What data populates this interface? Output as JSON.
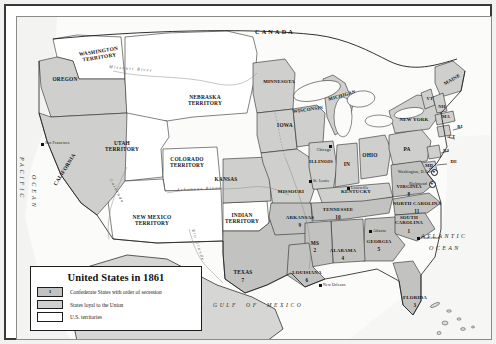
{
  "map": {
    "title": "United States in 1861",
    "legend": {
      "title": "United States in 1861",
      "items": [
        {
          "label": "Confederate States with order of secession",
          "swatch": "confederate",
          "sample_number": "1",
          "color": "#c2c2c0"
        },
        {
          "label": "States loyal to the Union",
          "swatch": "union",
          "color": "#cfcfcd"
        },
        {
          "label": "U.S. territories",
          "swatch": "territory",
          "color": "#ffffff"
        }
      ]
    },
    "countries": [
      {
        "name": "CANADA",
        "x": 268,
        "y": 14
      },
      {
        "name": "MEXICO",
        "x": 175,
        "y": 290
      }
    ],
    "oceans": [
      {
        "name": "PACIFIC",
        "x": 10,
        "y": 150
      },
      {
        "name": "OCEAN",
        "x": 10,
        "y": 185
      },
      {
        "name": "ATLANTIC",
        "x": 412,
        "y": 220
      },
      {
        "name": "OCEAN",
        "x": 420,
        "y": 232
      },
      {
        "name": "GULF  OF  MEXICO",
        "x": 238,
        "y": 288
      }
    ],
    "rivers": [
      {
        "name": "Missouri River",
        "x": 108,
        "y": 57
      },
      {
        "name": "Arkansas River",
        "x": 183,
        "y": 176
      },
      {
        "name": "Colorado",
        "x": 96,
        "y": 182
      },
      {
        "name": "Rio Grande",
        "x": 172,
        "y": 232
      }
    ],
    "confederate_states": [
      {
        "name": "SOUTH\nCAROLINA",
        "order": "1",
        "x": 391,
        "y": 203
      },
      {
        "name": "MS",
        "order": "2",
        "x": 298,
        "y": 228
      },
      {
        "name": "FLORIDA",
        "order": "3",
        "x": 398,
        "y": 283
      },
      {
        "name": "ALABAMA",
        "order": "4",
        "x": 325,
        "y": 235
      },
      {
        "name": "GEORGIA",
        "order": "5",
        "x": 361,
        "y": 228
      },
      {
        "name": "LOUISIANA",
        "order": "6",
        "x": 290,
        "y": 258
      },
      {
        "name": "TEXAS",
        "order": "7",
        "x": 226,
        "y": 258
      },
      {
        "name": "VIRGINIA",
        "order": "8",
        "x": 392,
        "y": 172
      },
      {
        "name": "ARKANSAS",
        "order": "9",
        "x": 283,
        "y": 203
      },
      {
        "name": "TENNESSEE",
        "order": "10",
        "x": 320,
        "y": 196
      },
      {
        "name": "NORTH CAROLINA",
        "order": "11",
        "x": 400,
        "y": 190
      }
    ],
    "union_states": [
      {
        "name": "OREGON",
        "x": 47,
        "y": 63
      },
      {
        "name": "CALIFORNIA",
        "x": 48,
        "y": 155
      },
      {
        "name": "KANSAS",
        "x": 208,
        "y": 166
      },
      {
        "name": "MINNESOTA",
        "x": 262,
        "y": 68
      },
      {
        "name": "IOWA",
        "x": 268,
        "y": 124
      },
      {
        "name": "MISSOURI",
        "x": 272,
        "y": 178
      },
      {
        "name": "WISCONSIN",
        "x": 291,
        "y": 94
      },
      {
        "name": "ILLINOIS",
        "x": 303,
        "y": 147
      },
      {
        "name": "MICHIGAN",
        "x": 324,
        "y": 83
      },
      {
        "name": "IN",
        "x": 330,
        "y": 150
      },
      {
        "name": "OHIO",
        "x": 351,
        "y": 142
      },
      {
        "name": "KENTUCKY",
        "x": 338,
        "y": 177
      },
      {
        "name": "PA",
        "x": 390,
        "y": 135
      },
      {
        "name": "NEW YORK",
        "x": 397,
        "y": 108
      },
      {
        "name": "MAINE",
        "x": 434,
        "y": 68
      },
      {
        "name": "VT",
        "x": 413,
        "y": 85
      },
      {
        "name": "NH",
        "x": 424,
        "y": 93
      },
      {
        "name": "MA",
        "x": 429,
        "y": 103
      },
      {
        "name": "RI",
        "x": 442,
        "y": 113
      },
      {
        "name": "CT",
        "x": 434,
        "y": 122
      },
      {
        "name": "NJ",
        "x": 428,
        "y": 137
      },
      {
        "name": "DE",
        "x": 436,
        "y": 148
      },
      {
        "name": "MD",
        "x": 412,
        "y": 152
      }
    ],
    "territories": [
      {
        "name": "WASHINGTON\nTERRITORY",
        "x": 80,
        "y": 40
      },
      {
        "name": "NEBRASKA\nTERRITORY",
        "x": 188,
        "y": 85
      },
      {
        "name": "UTAH\nTERRITORY",
        "x": 105,
        "y": 131
      },
      {
        "name": "COLORADO\nTERRITORY",
        "x": 169,
        "y": 147
      },
      {
        "name": "NEW MEXICO\nTERRITORY",
        "x": 134,
        "y": 206
      },
      {
        "name": "INDIAN\nTERRITORY",
        "x": 223,
        "y": 203
      }
    ],
    "cities": [
      {
        "name": "San Francisco",
        "x": 30,
        "y": 128,
        "type": "dot"
      },
      {
        "name": "Chicago",
        "x": 313,
        "y": 131,
        "type": "dot"
      },
      {
        "name": "St. Louis",
        "x": 297,
        "y": 166,
        "type": "dot"
      },
      {
        "name": "Louisville",
        "x": 334,
        "y": 171,
        "type": "dot"
      },
      {
        "name": "Atlanta",
        "x": 357,
        "y": 214,
        "type": "dot"
      },
      {
        "name": "Charleston",
        "x": 406,
        "y": 221,
        "type": "dot"
      },
      {
        "name": "New Orleans",
        "x": 307,
        "y": 268,
        "type": "dot"
      },
      {
        "name": "Washington, D.C.",
        "x": 398,
        "y": 157,
        "type": "capital"
      },
      {
        "name": "Richmond",
        "x": 399,
        "y": 168,
        "type": "capital"
      }
    ]
  }
}
